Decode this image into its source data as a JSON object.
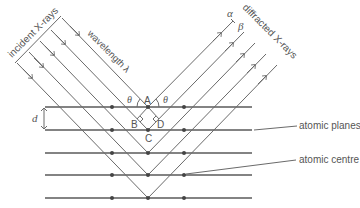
{
  "diagram": {
    "type": "Bragg X-ray diffraction schematic",
    "labels": {
      "incident": "incident X-rays",
      "wavelength": "wavelength λ",
      "diffracted": "diffracted X-rays",
      "alpha": "α",
      "beta": "β",
      "theta_left": "θ",
      "theta_right": "θ",
      "A": "A",
      "B": "B",
      "C": "C",
      "D": "D",
      "d": "d",
      "atomic_planes": "atomic planes",
      "atomic_centre": "atomic centre"
    },
    "colors": {
      "plane": "#5a5a5a",
      "ray": "#6a6a6a",
      "atom": "#444444",
      "text": "#555555"
    },
    "planes_y": [
      107,
      130,
      153,
      175,
      198
    ],
    "atoms_x": [
      112,
      148,
      184
    ],
    "ray_count": 5
  }
}
